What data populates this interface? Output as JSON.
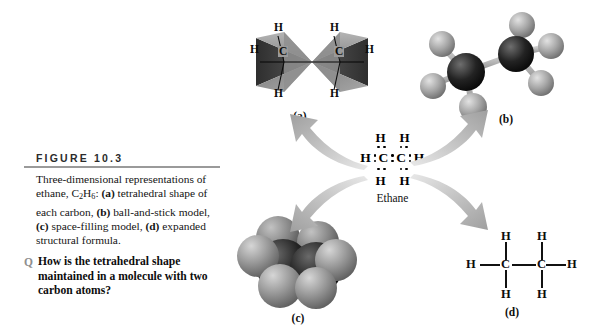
{
  "figure": {
    "header": "FIGURE 10.3",
    "caption_lines": [
      "Three-dimensional representations of",
      "ethane, C2H6: (a) tetrahedral shape of",
      "each carbon, (b) ball-and-stick model,",
      "(c) space-filling model, (d) expanded",
      "structural formula."
    ],
    "caption_plain": "Three-dimensional representations of ethane, C2H6: (a) tetrahedral shape of each carbon, (b) ball-and-stick model, (c) space-filling model, (d) expanded structural formula.",
    "caption_parts": {
      "t1": "Three-dimensional representations of ethane, C",
      "sub1": "2",
      "t2": "H",
      "sub2": "6",
      "t3": ": ",
      "lbl_a": "(a)",
      "t4": " tetrahedral shape of each carbon, ",
      "lbl_b": "(b)",
      "t5": " ball-and-stick model, ",
      "lbl_c": "(c)",
      "t6": " space-filling model, ",
      "lbl_d": "(d)",
      "t7": " expanded structural formula."
    },
    "question_marker": "Q",
    "question_text": "How is the tetrahedral shape maintained in a molecule with two carbon atoms?"
  },
  "panels": {
    "a": {
      "label": "(a)",
      "name": "tetrahedral-shape-diagram"
    },
    "b": {
      "label": "(b)",
      "name": "ball-and-stick-model"
    },
    "c": {
      "label": "(c)",
      "name": "space-filling-model"
    },
    "d": {
      "label": "(d)",
      "name": "expanded-structural-formula"
    }
  },
  "lewis": {
    "molecule_name": "Ethane",
    "top_atoms": [
      "H",
      "H"
    ],
    "bottom_atoms": [
      "H",
      "H"
    ],
    "middle_atoms": [
      "H",
      "C",
      "C",
      "H"
    ],
    "left_h": "H",
    "right_h": "H",
    "carbon_left": "C",
    "carbon_right": "C"
  },
  "structural_formula": {
    "top_h": [
      "H",
      "H"
    ],
    "bottom_h": [
      "H",
      "H"
    ],
    "left_h": "H",
    "right_h": "H",
    "carbons": [
      "C",
      "C"
    ]
  },
  "tetrahedra": {
    "carbons": [
      "C",
      "C"
    ],
    "hydrogens": [
      "H",
      "H",
      "H",
      "H",
      "H",
      "H"
    ],
    "left_h": "H",
    "right_h": "H",
    "top_left_h": "H",
    "top_right_h": "H",
    "bottom_left_h": "H",
    "bottom_right_h": "H"
  },
  "colors": {
    "rule": "#9a9a9a",
    "header_text": "#2b2b2b",
    "question_marker": "#8f8f8f",
    "arrow": "#b9b9b9",
    "carbon_sphere": "#1c1c1c",
    "hydrogen_sphere": "#9d9d9d",
    "text": "#0d0d0d"
  }
}
